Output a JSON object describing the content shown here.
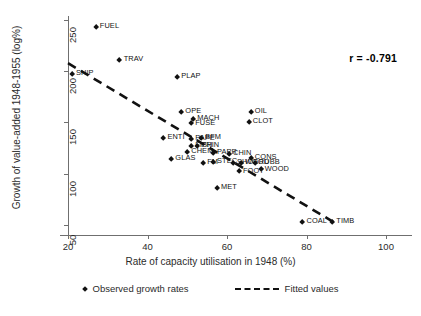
{
  "chart_data": {
    "type": "scatter",
    "title": "",
    "xlabel": "Rate of capacity utilisation in 1948 (%)",
    "ylabel": "Growth of value-added 1948-1955 (log%)",
    "xlim": [
      20,
      100
    ],
    "ylim": [
      40,
      258
    ],
    "xticks": [
      20,
      40,
      60,
      80,
      100
    ],
    "yticks": [
      50,
      100,
      150,
      200,
      250
    ],
    "grid": false,
    "annotation": "r = -0.791",
    "correlation": -0.791,
    "legend_position": "bottom",
    "series": [
      {
        "name": "Observed growth rates",
        "marker": "diamond",
        "points": [
          {
            "label": "FUEL",
            "x": 27.0,
            "y": 243.0
          },
          {
            "label": "TRAV",
            "x": 33.0,
            "y": 211.0
          },
          {
            "label": "SHIP",
            "x": 21.0,
            "y": 197.0
          },
          {
            "label": "PLAP",
            "x": 47.5,
            "y": 194.0
          },
          {
            "label": "OPE",
            "x": 48.5,
            "y": 160.0
          },
          {
            "label": "MACH",
            "x": 51.5,
            "y": 153.0
          },
          {
            "label": "FUSE",
            "x": 51.0,
            "y": 149.0
          },
          {
            "label": "OIL",
            "x": 66.0,
            "y": 160.0
          },
          {
            "label": "CLOT",
            "x": 65.5,
            "y": 150.0
          },
          {
            "label": "ENTI",
            "x": 44.0,
            "y": 135.0
          },
          {
            "label": "BFM",
            "x": 53.5,
            "y": 135.0
          },
          {
            "label": "PAPE",
            "x": 51.0,
            "y": 134.0
          },
          {
            "label": "FISH",
            "x": 51.0,
            "y": 127.0
          },
          {
            "label": "PRIN",
            "x": 52.5,
            "y": 127.0
          },
          {
            "label": "CHEM",
            "x": 50.0,
            "y": 121.0
          },
          {
            "label": "GLAS",
            "x": 46.0,
            "y": 114.0
          },
          {
            "label": "PAPR",
            "x": 56.5,
            "y": 120.0
          },
          {
            "label": "CHIN",
            "x": 60.5,
            "y": 119.0
          },
          {
            "label": "FM",
            "x": 54.0,
            "y": 110.0
          },
          {
            "label": "STEC",
            "x": 56.5,
            "y": 111.0
          },
          {
            "label": "SHOE",
            "x": 61.5,
            "y": 110.0
          },
          {
            "label": "WOOD",
            "x": 63.5,
            "y": 110.0
          },
          {
            "label": "CONS",
            "x": 66.0,
            "y": 115.0
          },
          {
            "label": "RUBB",
            "x": 67.0,
            "y": 110.0
          },
          {
            "label": "WOOD2",
            "x": 68.5,
            "y": 104.0
          },
          {
            "label": "FOOT",
            "x": 63.0,
            "y": 102.0
          },
          {
            "label": "MET",
            "x": 57.5,
            "y": 86.0
          },
          {
            "label": "COAL",
            "x": 79.0,
            "y": 53.0
          },
          {
            "label": "TIMB",
            "x": 86.5,
            "y": 53.0
          }
        ]
      }
    ],
    "fit_line": {
      "name": "Fitted values",
      "style": "dashed",
      "x_start": 20.0,
      "y_start": 208.0,
      "x_end": 87.5,
      "y_end": 51.0
    }
  },
  "legend": {
    "observed_label": "Observed growth rates",
    "fitted_label": "Fitted values"
  }
}
